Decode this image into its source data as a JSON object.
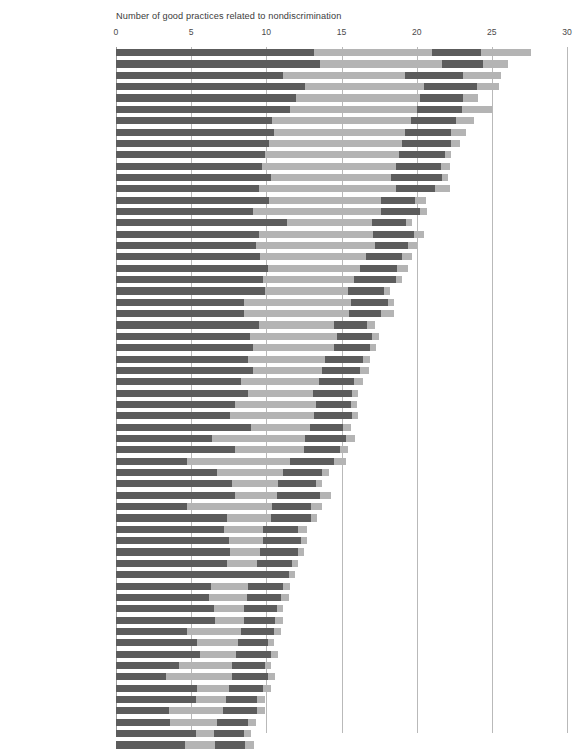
{
  "chart_data": {
    "type": "bar",
    "orientation": "horizontal",
    "stacked": true,
    "title": "Number of good practices related to nondiscrimination",
    "xlabel": "",
    "ylabel": "",
    "xlim": [
      0,
      30
    ],
    "xticks": [
      0,
      5,
      10,
      15,
      20,
      25,
      30
    ],
    "xtick_labels": [
      "0",
      "5",
      "10",
      "15",
      "20",
      "25",
      "30"
    ],
    "grid": true,
    "legend": null,
    "colors": {
      "dark": "#5c5c5c",
      "light": "#b4b4b4",
      "gridline": "#b9b9b9",
      "text": "#4a4a4a"
    },
    "segment_order": [
      "dark",
      "light",
      "dark",
      "light"
    ],
    "categories": [
      "Spain",
      "Poland",
      "Greece",
      "Italy",
      "Netherlands",
      "Romania",
      "Tanzania",
      "Zambia",
      "Kenya",
      "Colombia",
      "Denmark",
      "Uruguay",
      "Malawi",
      "Bolivia",
      "Mozambique",
      "Mali",
      "Rwanda",
      "Burundi",
      "Zimbabwe",
      "Niger",
      "Philippines",
      "Georgia",
      "Morocco",
      "Kazakhstan",
      "Mexico",
      "Tajikistan",
      "Vietnam",
      "Bosnia and Herzegovina",
      "Peru",
      "Uganda",
      "Ghana",
      "Senegal",
      "Nicaragua",
      "Turkey",
      "Kyrgyz Republic",
      "Chile",
      "Bangladesh",
      "Côte d'Ivoire",
      "Korea, Rep.",
      "Guatemala",
      "Lao PDR",
      "Serbia",
      "Russian Federation",
      "Sudan",
      "Nigeria",
      "Cameroon",
      "India",
      "Armenia",
      "Benin",
      "Burkina Faso",
      "Cambodia",
      "Nepal",
      "Ukraine",
      "Jordan",
      "Egypt, Arab Rep.",
      "Liberia",
      "Sri Lanka",
      "Thailand",
      "Ethiopia",
      "Myanmar",
      "Malaysia",
      "Haiti"
    ],
    "series": [
      {
        "name": "segment-1",
        "style": "dark",
        "values": [
          13.2,
          13.6,
          11.1,
          12.6,
          12.0,
          11.6,
          10.4,
          10.5,
          10.2,
          9.9,
          9.7,
          10.3,
          9.5,
          10.2,
          9.1,
          11.4,
          9.5,
          9.3,
          9.6,
          10.1,
          9.8,
          9.9,
          8.5,
          8.5,
          9.5,
          8.9,
          9.1,
          8.8,
          9.1,
          8.3,
          8.8,
          7.9,
          7.6,
          9.0,
          6.4,
          7.9,
          4.7,
          6.7,
          7.7,
          7.9,
          4.7,
          7.4,
          7.2,
          7.5,
          7.6,
          7.4,
          9.9,
          6.3,
          6.2,
          6.5,
          6.6,
          4.7,
          5.4,
          5.6,
          4.2,
          3.3,
          5.4,
          5.3,
          3.5,
          3.6,
          5.3,
          4.6
        ]
      },
      {
        "name": "segment-2",
        "style": "light",
        "values": [
          7.8,
          8.1,
          8.1,
          7.9,
          8.2,
          8.4,
          9.2,
          8.7,
          8.8,
          8.9,
          8.9,
          8.0,
          9.1,
          7.4,
          8.5,
          5.6,
          7.6,
          7.9,
          7.0,
          6.1,
          6.0,
          5.5,
          7.1,
          7.0,
          5.0,
          5.8,
          5.4,
          5.1,
          4.6,
          5.2,
          4.3,
          5.4,
          5.6,
          3.9,
          6.2,
          4.6,
          6.9,
          4.4,
          3.1,
          2.8,
          5.7,
          2.9,
          2.6,
          2.3,
          2.0,
          2.0,
          -0.8,
          2.5,
          2.5,
          2.0,
          1.9,
          3.6,
          2.7,
          2.4,
          3.5,
          4.4,
          2.1,
          2.0,
          3.6,
          3.1,
          1.2,
          2.0
        ]
      },
      {
        "name": "segment-3",
        "style": "dark",
        "values": [
          3.3,
          2.7,
          3.9,
          3.5,
          2.9,
          3.0,
          3.0,
          3.1,
          3.3,
          3.1,
          3.0,
          3.4,
          2.6,
          2.3,
          2.6,
          2.3,
          2.7,
          2.2,
          2.4,
          2.5,
          2.8,
          2.4,
          2.5,
          2.1,
          2.2,
          2.3,
          2.4,
          2.5,
          2.5,
          2.3,
          2.6,
          2.3,
          2.5,
          2.2,
          2.7,
          2.4,
          2.9,
          2.6,
          2.5,
          2.9,
          2.6,
          2.7,
          2.3,
          2.5,
          2.5,
          2.3,
          2.4,
          2.3,
          2.3,
          2.2,
          2.1,
          2.2,
          2.0,
          2.3,
          2.2,
          2.4,
          2.3,
          2.1,
          2.3,
          2.1,
          2.0,
          2.0
        ]
      },
      {
        "name": "segment-4",
        "style": "light",
        "values": [
          3.3,
          1.7,
          2.5,
          1.5,
          1.0,
          2.0,
          1.2,
          1.0,
          0.6,
          0.4,
          0.6,
          0.4,
          1.0,
          0.7,
          0.5,
          0.4,
          0.7,
          0.6,
          0.7,
          0.7,
          0.4,
          0.4,
          0.4,
          0.9,
          0.5,
          0.5,
          0.4,
          0.5,
          0.6,
          0.6,
          0.4,
          0.4,
          0.4,
          0.5,
          0.6,
          0.5,
          0.8,
          0.5,
          0.4,
          0.7,
          0.7,
          0.4,
          0.6,
          0.4,
          0.4,
          0.4,
          0.4,
          0.5,
          0.5,
          0.4,
          0.5,
          0.5,
          0.4,
          0.5,
          0.4,
          0.5,
          0.5,
          0.5,
          0.5,
          0.5,
          0.5,
          0.6
        ]
      }
    ],
    "totals": [
      27.6,
      26.1,
      25.6,
      25.5,
      24.1,
      25.0,
      23.8,
      23.3,
      22.9,
      22.3,
      22.2,
      22.1,
      22.2,
      20.6,
      20.7,
      19.7,
      20.5,
      20.0,
      19.7,
      19.4,
      19.0,
      18.2,
      18.5,
      18.5,
      17.2,
      17.5,
      17.3,
      16.9,
      16.8,
      16.4,
      16.1,
      16.0,
      16.1,
      15.6,
      15.9,
      15.4,
      15.3,
      14.2,
      13.7,
      14.3,
      13.7,
      13.4,
      12.7,
      12.7,
      12.5,
      12.1,
      11.9,
      11.6,
      11.5,
      11.1,
      11.1,
      11.0,
      10.5,
      10.8,
      10.3,
      10.6,
      10.3,
      9.9,
      9.9,
      9.3,
      9.0,
      9.2
    ]
  }
}
